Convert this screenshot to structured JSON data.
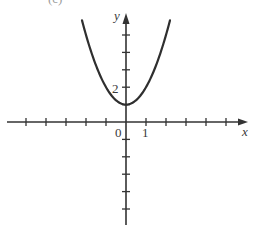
{
  "figure": {
    "corner_label": "(c)",
    "function": "y = x^2 + 1",
    "colors": {
      "axis": "#333333",
      "curve": "#2f2f2f",
      "text": "#3a3a3a",
      "background": "#ffffff"
    }
  },
  "chart_data": {
    "type": "line",
    "title": "",
    "xlabel": "x",
    "ylabel": "y",
    "tick_labels": {
      "x": [
        "0",
        "1"
      ],
      "y": [
        "2"
      ]
    },
    "xlim": [
      -6,
      6
    ],
    "ylim": [
      -6,
      6
    ],
    "x_ticks": [
      -5,
      -4,
      -3,
      -2,
      -1,
      1,
      2,
      3,
      4,
      5
    ],
    "y_ticks": [
      -5,
      -4,
      -3,
      -2,
      -1,
      1,
      2,
      3,
      4,
      5
    ],
    "grid": false,
    "series": [
      {
        "name": "y = x^2 + 1",
        "x": [
          -2.2,
          -2.0,
          -1.5,
          -1.0,
          -0.5,
          0.0,
          0.5,
          1.0,
          1.5,
          2.0,
          2.2
        ],
        "y": [
          5.84,
          5.0,
          3.25,
          2.0,
          1.25,
          1.0,
          1.25,
          2.0,
          3.25,
          5.0,
          5.84
        ]
      }
    ]
  },
  "labels": {
    "x_axis": "x",
    "y_axis": "y",
    "origin": "0",
    "x_one": "1",
    "y_two": "2"
  }
}
